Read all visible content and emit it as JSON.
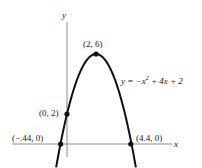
{
  "chart_data": {
    "type": "line",
    "title": "",
    "xlabel": "x",
    "ylabel": "y",
    "equation": "y = −x² + 4x + 2",
    "equation_parts": {
      "lhs": "y = −x",
      "exp": "2",
      "rhs": " + 4x + 2"
    },
    "grid": false,
    "series": [
      {
        "name": "y = -x^2 + 4x + 2",
        "x": [
          -0.75,
          -0.44,
          0,
          1,
          2,
          3,
          4,
          4.4,
          4.75
        ],
        "y": [
          -0.56,
          0,
          2,
          5,
          6,
          5,
          2,
          0,
          -0.56
        ]
      }
    ],
    "points": [
      {
        "x": -0.44,
        "y": 0,
        "label": "(−.44, 0)"
      },
      {
        "x": 0,
        "y": 2,
        "label": "(0, 2)"
      },
      {
        "x": 2,
        "y": 6,
        "label": "(2, 6)"
      },
      {
        "x": 4.4,
        "y": 0,
        "label": "(4.4, 0)"
      }
    ],
    "xlim": [
      -3.8,
      7.2
    ],
    "ylim": [
      -0.9,
      8.2
    ]
  },
  "colors": {
    "curve": "#111111",
    "axis": "#888888",
    "text": "#222222"
  }
}
